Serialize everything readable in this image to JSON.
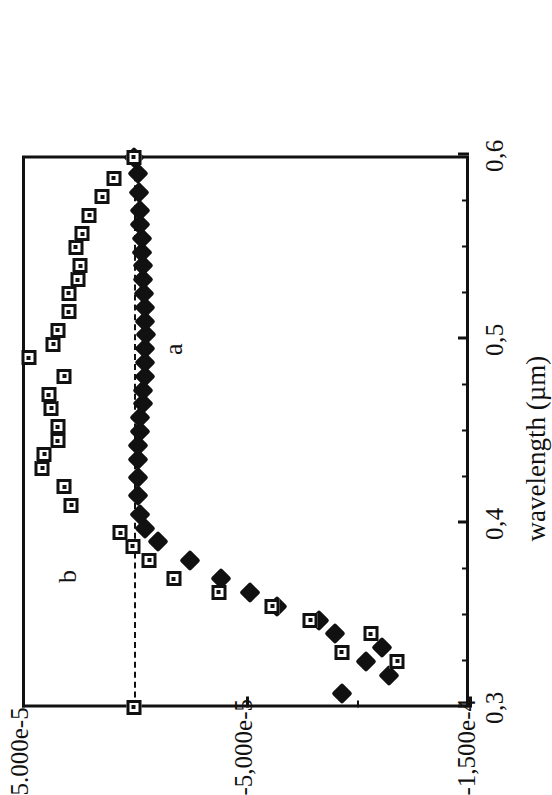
{
  "figure": {
    "caption_visible": false,
    "series_labels": [
      {
        "id": "a",
        "text": "a",
        "marker": "filled-diamond"
      },
      {
        "id": "b",
        "text": "b",
        "marker": "open-square"
      }
    ]
  },
  "chart_data": {
    "type": "scatter",
    "title": "",
    "xlabel": "wavelength (µm)",
    "ylabel": "",
    "xlim": [
      0.3,
      0.6
    ],
    "ylim": [
      -0.00015,
      5e-05
    ],
    "grid": false,
    "legend": "inline-labels",
    "x_tick_labels": [
      "0,3",
      "0,4",
      "0,5",
      "0,6"
    ],
    "x_tick_values": [
      0.3,
      0.4,
      0.5,
      0.6
    ],
    "x_minor_ticks": [
      0.325,
      0.35,
      0.375,
      0.425,
      0.45,
      0.475,
      0.525,
      0.55,
      0.575
    ],
    "y_tick_labels": [
      "5.000e-5",
      "-5,000e-5",
      "-1,500e-4"
    ],
    "y_tick_values": [
      5e-05,
      -5e-05,
      -0.00015
    ],
    "y_minor_ticks": [
      0.0,
      -0.0001
    ],
    "zero_reference_line": 0.0,
    "series": [
      {
        "name": "a",
        "marker": "filled-diamond",
        "color": "#111111",
        "points": [
          [
            0.3075,
            -9.3e-05
          ],
          [
            0.3175,
            -0.000114
          ],
          [
            0.325,
            -0.000104
          ],
          [
            0.3325,
            -0.000111
          ],
          [
            0.34,
            -9e-05
          ],
          [
            0.3475,
            -8.3e-05
          ],
          [
            0.355,
            -6.4e-05
          ],
          [
            0.3625,
            -5.2e-05
          ],
          [
            0.37,
            -3.9e-05
          ],
          [
            0.38,
            -2.5e-05
          ],
          [
            0.39,
            -1.1e-05
          ],
          [
            0.3975,
            -5e-06
          ],
          [
            0.405,
            -3e-06
          ],
          [
            0.415,
            -2e-06
          ],
          [
            0.425,
            -2e-06
          ],
          [
            0.435,
            -2e-06
          ],
          [
            0.4425,
            -2e-06
          ],
          [
            0.45,
            -3e-06
          ],
          [
            0.4575,
            -3e-06
          ],
          [
            0.465,
            -4e-06
          ],
          [
            0.4725,
            -4e-06
          ],
          [
            0.48,
            -5e-06
          ],
          [
            0.4875,
            -5e-06
          ],
          [
            0.495,
            -5e-06
          ],
          [
            0.5025,
            -5.5e-06
          ],
          [
            0.51,
            -5e-06
          ],
          [
            0.5175,
            -5e-06
          ],
          [
            0.525,
            -4.5e-06
          ],
          [
            0.5325,
            -4e-06
          ],
          [
            0.54,
            -4e-06
          ],
          [
            0.5475,
            -3.5e-06
          ],
          [
            0.555,
            -3.5e-06
          ],
          [
            0.5625,
            -3e-06
          ],
          [
            0.57,
            -3e-06
          ],
          [
            0.58,
            -2.5e-06
          ],
          [
            0.59,
            -2e-06
          ],
          [
            0.599,
            0.0
          ]
        ]
      },
      {
        "name": "b",
        "marker": "open-square",
        "color": "#111111",
        "points": [
          [
            0.3,
            0.0
          ],
          [
            0.325,
            -0.000118
          ],
          [
            0.33,
            -9.3e-05
          ],
          [
            0.34,
            -0.000106
          ],
          [
            0.3475,
            -7.9e-05
          ],
          [
            0.355,
            -6.2e-05
          ],
          [
            0.3625,
            -3.8e-05
          ],
          [
            0.37,
            -1.8e-05
          ],
          [
            0.38,
            -7e-06
          ],
          [
            0.3875,
            5e-07
          ],
          [
            0.395,
            6e-06
          ],
          [
            0.41,
            2.8e-05
          ],
          [
            0.42,
            3.1e-05
          ],
          [
            0.43,
            4.1e-05
          ],
          [
            0.4375,
            4e-05
          ],
          [
            0.445,
            3.4e-05
          ],
          [
            0.4525,
            3.4e-05
          ],
          [
            0.4625,
            3.7e-05
          ],
          [
            0.47,
            3.8e-05
          ],
          [
            0.48,
            3.1e-05
          ],
          [
            0.49,
            4.7e-05
          ],
          [
            0.4975,
            3.6e-05
          ],
          [
            0.505,
            3.4e-05
          ],
          [
            0.515,
            2.9e-05
          ],
          [
            0.525,
            2.9e-05
          ],
          [
            0.5325,
            2.5e-05
          ],
          [
            0.54,
            2.4e-05
          ],
          [
            0.55,
            2.6e-05
          ],
          [
            0.5575,
            2.3e-05
          ],
          [
            0.5675,
            2e-05
          ],
          [
            0.5775,
            1.4e-05
          ],
          [
            0.5875,
            9e-06
          ],
          [
            0.599,
            0.0
          ]
        ]
      }
    ]
  }
}
